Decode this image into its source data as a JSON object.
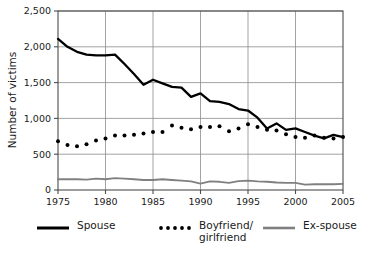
{
  "chart_data": {
    "type": "line",
    "title": "",
    "xlabel": "",
    "ylabel": "Number of victims",
    "xlim": [
      1975,
      2005
    ],
    "ylim": [
      0,
      2500
    ],
    "grid": true,
    "legend_position": "bottom",
    "x": [
      1975,
      1976,
      1977,
      1978,
      1979,
      1980,
      1981,
      1982,
      1983,
      1984,
      1985,
      1986,
      1987,
      1988,
      1989,
      1990,
      1991,
      1992,
      1993,
      1994,
      1995,
      1996,
      1997,
      1998,
      1999,
      2000,
      2001,
      2002,
      2003,
      2004,
      2005
    ],
    "xticks": [
      1975,
      1980,
      1985,
      1990,
      1995,
      2000,
      2005
    ],
    "xticklabels": [
      "1975",
      "1980",
      "1985",
      "1990",
      "1995",
      "2000",
      "2005"
    ],
    "yticks": [
      0,
      500,
      1000,
      1500,
      2000,
      2500
    ],
    "yticklabels": [
      "0",
      "500",
      "1,000",
      "1,500",
      "2,000",
      "2,500"
    ],
    "series": [
      {
        "name": "Spouse",
        "style": "solid",
        "color": "#000000",
        "values": [
          2110,
          2000,
          1930,
          1890,
          1880,
          1880,
          1890,
          1760,
          1620,
          1470,
          1540,
          1490,
          1440,
          1430,
          1300,
          1350,
          1240,
          1230,
          1200,
          1130,
          1110,
          1010,
          860,
          930,
          840,
          860,
          810,
          760,
          720,
          770,
          740
        ]
      },
      {
        "name": "Boyfriend/\ngirlfriend",
        "style": "dotted",
        "color": "#000000",
        "values": [
          680,
          630,
          610,
          640,
          690,
          720,
          760,
          760,
          770,
          790,
          810,
          810,
          900,
          870,
          850,
          880,
          880,
          890,
          820,
          860,
          920,
          880,
          840,
          830,
          780,
          740,
          730,
          760,
          730,
          720,
          740
        ]
      },
      {
        "name": "Ex-spouse",
        "style": "solid",
        "color": "#808080",
        "values": [
          150,
          150,
          150,
          145,
          160,
          150,
          165,
          160,
          150,
          140,
          140,
          150,
          140,
          130,
          120,
          90,
          120,
          115,
          100,
          125,
          130,
          120,
          115,
          105,
          100,
          100,
          75,
          80,
          80,
          80,
          85
        ]
      }
    ]
  },
  "legend": {
    "items": [
      {
        "label": "Spouse",
        "marker": "solid-line",
        "color": "#000000"
      },
      {
        "label": "Boyfriend/\ngirlfriend",
        "marker": "dotted-line",
        "color": "#000000"
      },
      {
        "label": "Ex-spouse",
        "marker": "solid-line",
        "color": "#808080"
      }
    ]
  },
  "axes": {
    "y_title": "Number of victims"
  }
}
